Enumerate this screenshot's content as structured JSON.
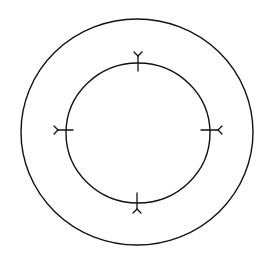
{
  "diagram": {
    "background": "#ffffff",
    "stroke_color": "#111111",
    "outer_circle": {
      "cx": 137,
      "cy": 132,
      "rx": 116,
      "ry": 113
    },
    "inner_circle": {
      "cx": 138,
      "cy": 133,
      "rx": 72,
      "ry": 70
    },
    "markers": [
      {
        "position": "top",
        "x": 138,
        "y": 63,
        "direction": "up"
      },
      {
        "position": "left",
        "x": 66,
        "y": 130,
        "direction": "left"
      },
      {
        "position": "right",
        "x": 210,
        "y": 130,
        "direction": "right"
      },
      {
        "position": "bottom",
        "x": 137,
        "y": 203,
        "direction": "down"
      }
    ]
  }
}
